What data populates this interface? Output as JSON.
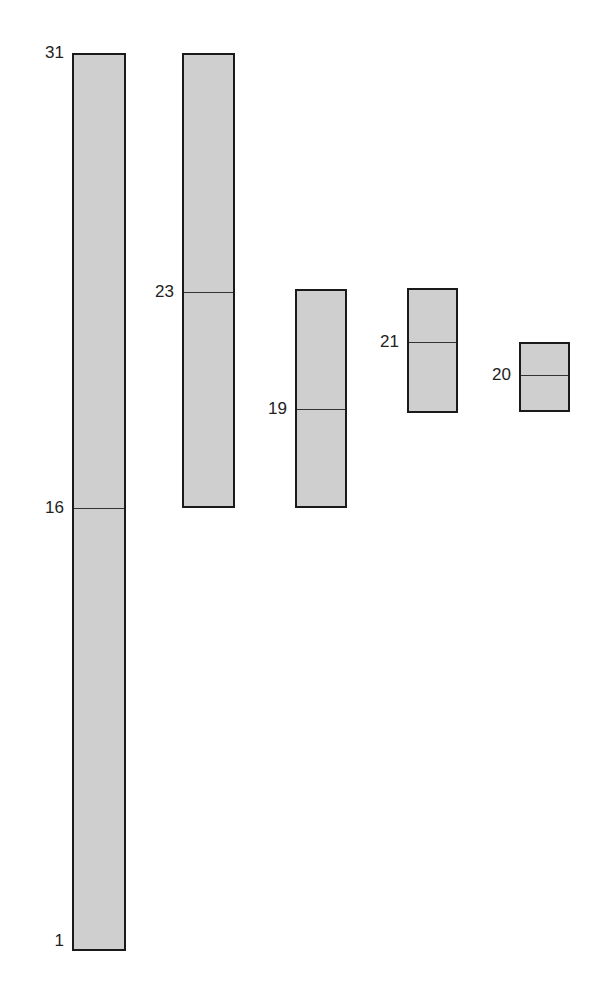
{
  "diagram": {
    "fill_color": "#cfcfcf",
    "border_color": "#1a1a1a",
    "segments": [
      {
        "id": "seg-1",
        "top_label": "31",
        "mid_label": "16",
        "bottom_label": "1",
        "left": 72,
        "top": 53,
        "width": 54,
        "height": 898,
        "divider_offset": 455
      },
      {
        "id": "seg-2",
        "mid_label": "23",
        "left": 182,
        "top": 53,
        "width": 53,
        "height": 455,
        "divider_offset": 239
      },
      {
        "id": "seg-3",
        "mid_label": "19",
        "left": 295,
        "top": 289,
        "width": 52,
        "height": 219,
        "divider_offset": 120
      },
      {
        "id": "seg-4",
        "mid_label": "21",
        "left": 407,
        "top": 288,
        "width": 51,
        "height": 125,
        "divider_offset": 54
      },
      {
        "id": "seg-5",
        "mid_label": "20",
        "left": 519,
        "top": 342,
        "width": 51,
        "height": 70,
        "divider_offset": 33
      }
    ]
  }
}
